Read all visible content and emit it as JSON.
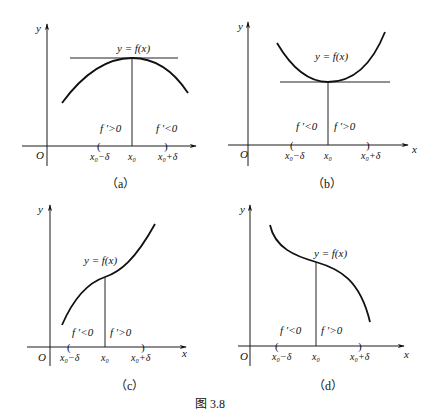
{
  "figure": {
    "caption": "图 3.8"
  },
  "panels": [
    {
      "id": "a",
      "label": "（a）",
      "y_axis_label": "y",
      "x_axis_label": "",
      "origin_label": "O",
      "curve_label": "y = f(x)",
      "left_derivative": "f ′>0",
      "right_derivative": "f ′<0",
      "tick_left": "x₀−δ",
      "tick_center": "x₀",
      "tick_right": "x₀+δ",
      "description": "local maximum with horizontal tangent"
    },
    {
      "id": "b",
      "label": "（b）",
      "y_axis_label": "y",
      "x_axis_label": "x",
      "origin_label": "O",
      "curve_label": "y = f(x)",
      "left_derivative": "f ′<0",
      "right_derivative": "f ′>0",
      "tick_left": "x₀−δ",
      "tick_center": "x₀",
      "tick_right": "x₀+δ",
      "description": "local minimum with horizontal tangent"
    },
    {
      "id": "c",
      "label": "（c）",
      "y_axis_label": "y",
      "x_axis_label": "x",
      "origin_label": "O",
      "curve_label": "y = f(x)",
      "left_derivative": "f ′<0",
      "right_derivative": "f ′>0",
      "tick_left": "x₀−δ",
      "tick_center": "x₀",
      "tick_right": "x₀+δ",
      "description": "increasing curve through inflection point"
    },
    {
      "id": "d",
      "label": "（d）",
      "y_axis_label": "y",
      "x_axis_label": "x",
      "origin_label": "O",
      "curve_label": "y = f(x)",
      "left_derivative": "f ′<0",
      "right_derivative": "f ′>0",
      "tick_left": "x₀−δ",
      "tick_center": "x₀",
      "tick_right": "x₀+δ",
      "description": "decreasing curve through inflection point"
    }
  ]
}
